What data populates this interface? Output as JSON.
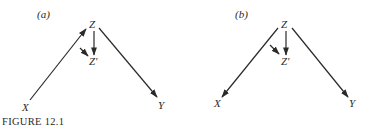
{
  "caption": "FIGURE 12.1",
  "panels": [
    {
      "id": "a",
      "label": "(a)",
      "nodes": {
        "Z": "Z",
        "Zp": "Z′",
        "X": "X",
        "Y": "Y"
      },
      "edges": [
        {
          "from": "X",
          "to": "Z"
        },
        {
          "from": "Z",
          "to": "Y"
        },
        {
          "from": "Z",
          "to": "Z′"
        },
        {
          "from": "edge X→Z",
          "to": "Z′",
          "note": "short arrow pointing into Z′ from the X→Z edge"
        }
      ]
    },
    {
      "id": "b",
      "label": "(b)",
      "nodes": {
        "Z": "Z",
        "Zp": "Z′",
        "X": "X",
        "Y": "Y"
      },
      "edges": [
        {
          "from": "Z",
          "to": "X"
        },
        {
          "from": "Z",
          "to": "Y"
        },
        {
          "from": "Z",
          "to": "Z′"
        },
        {
          "from": "edge Z→X",
          "to": "Z′",
          "note": "short arrow pointing into Z′ from the Z→X edge"
        }
      ]
    }
  ],
  "colors": {
    "ink": "#2a2a2a",
    "background": "#ffffff"
  }
}
